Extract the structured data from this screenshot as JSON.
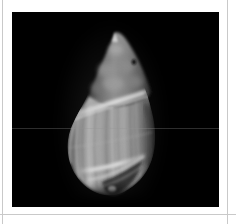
{
  "frame": {
    "background_color": "#ffffff",
    "rule_color": "#c9c9c9",
    "plate_background": "#000000",
    "plate_left": 12,
    "plate_top": 12,
    "plate_width": 207,
    "plate_height": 195
  },
  "image": {
    "subject": "seashell",
    "subject_detail": "gastropod shell, mitre / olive type with tall pointed spire and striated body whorl",
    "color_mode": "grayscale",
    "background_color": "#000000",
    "lighting": "front-lit specimen photograph on black ground"
  },
  "artifacts": {
    "scanline_label": "horizontal scan line",
    "scanline_y": 116,
    "scanline_color": "#969696"
  },
  "shell": {
    "apex_x": 103,
    "apex_y": 20,
    "base_y": 183,
    "left_edge_x": 54,
    "right_edge_x": 143,
    "highlight_color": "#e8e8e8",
    "midtone_color": "#9a9a9a",
    "shadow_color": "#2a2a2a",
    "parts": [
      {
        "name": "apex",
        "label": "apex"
      },
      {
        "name": "spire",
        "label": "spire"
      },
      {
        "name": "shoulder-band",
        "label": "shoulder band"
      },
      {
        "name": "body-whorl",
        "label": "body whorl"
      },
      {
        "name": "axial-striations",
        "label": "axial striations"
      },
      {
        "name": "aperture",
        "label": "aperture"
      },
      {
        "name": "siphonal-canal",
        "label": "siphonal canal"
      }
    ]
  },
  "caption": {
    "text": ""
  }
}
